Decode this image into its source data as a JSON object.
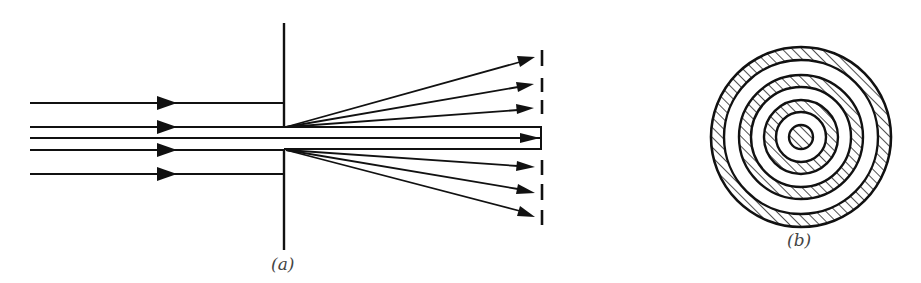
{
  "figure": {
    "panels": [
      {
        "id": "a",
        "label": "(a)",
        "description": "Parallel rays incident on a slit/aperture in a barrier, diffracting into a central beam and side-diffracted rays toward a screen"
      },
      {
        "id": "b",
        "label": "(b)",
        "description": "Circular diffraction pattern: concentric alternating hatched (bright) and white (dark) rings"
      }
    ],
    "colors": {
      "ink": "#111111",
      "hatch": "#222222",
      "background": "#ffffff",
      "label": "#444444"
    }
  },
  "panel_a": {
    "incident_rays_y": [
      103,
      127,
      150,
      174
    ],
    "axis_line_y": 138,
    "barrier_x": 284,
    "barrier_top": 23,
    "barrier_bottom": 250,
    "aperture": [
      127,
      150
    ],
    "screen_x": 542,
    "diffracted_rays_top": [
      57,
      84,
      108
    ],
    "diffracted_rays_bottom": [
      167,
      193,
      216
    ],
    "screen_dashes": [
      [
        50,
        66
      ],
      [
        78,
        92
      ],
      [
        100,
        114
      ],
      [
        160,
        175
      ],
      [
        184,
        200
      ],
      [
        210,
        225
      ]
    ]
  },
  "panel_b": {
    "center": [
      801,
      137
    ],
    "rings": [
      {
        "inner": 77,
        "outer": 91,
        "type": "hatched"
      },
      {
        "inner": 62,
        "outer": 77,
        "type": "white"
      },
      {
        "inner": 50,
        "outer": 62,
        "type": "hatched"
      },
      {
        "inner": 37,
        "outer": 50,
        "type": "white"
      },
      {
        "inner": 25,
        "outer": 37,
        "type": "hatched"
      },
      {
        "inner": 12,
        "outer": 25,
        "type": "white"
      },
      {
        "inner": 0,
        "outer": 12,
        "type": "hatched"
      }
    ]
  }
}
